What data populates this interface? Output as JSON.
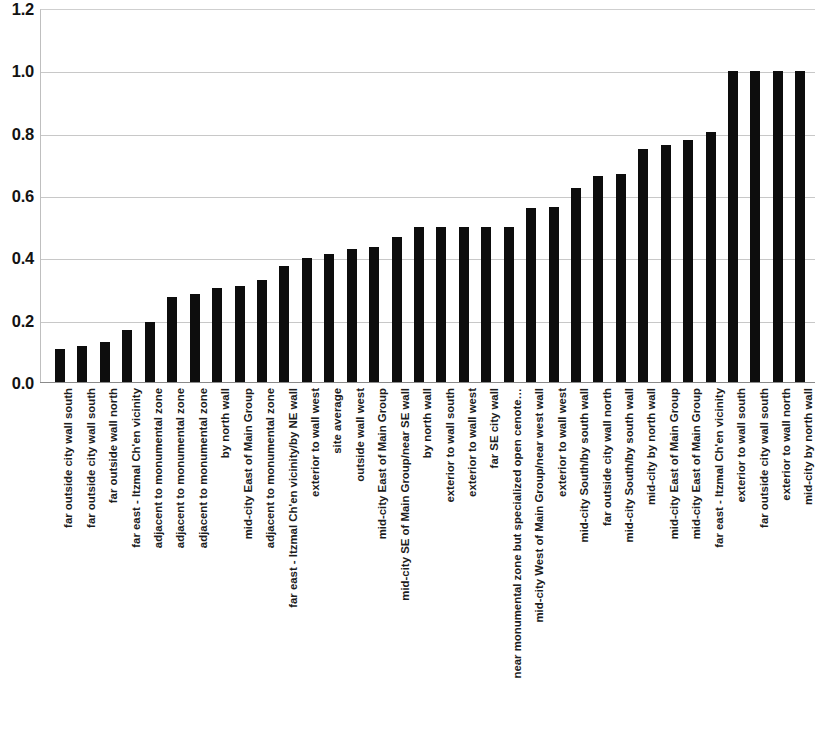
{
  "chart_data": {
    "type": "bar",
    "title": "",
    "subtitle": "",
    "xlabel": "",
    "ylabel": "",
    "ylim": [
      0.0,
      1.2
    ],
    "ytick_labels": [
      "1.2",
      "1.0",
      "0.8",
      "0.6",
      "0.4",
      "0.2",
      "0.0"
    ],
    "ytick_values": [
      1.2,
      1.0,
      0.8,
      0.6,
      0.4,
      0.2,
      0.0
    ],
    "grid": true,
    "gridlines_at": [
      1.0,
      0.8,
      0.6,
      0.4,
      0.2
    ],
    "legend": [],
    "legend_position": "none",
    "bar_color": "#0d0d0d",
    "note": "rightmost bar is clipped by the image edge",
    "categories": [
      "far outside city wall south",
      "far outside city wall south",
      "far outside wall north",
      "far east - Itzmal Ch'en vicinity",
      "adjacent to monumental zone",
      "adjacent to monumental zone",
      "adjacent to monumental zone",
      "by north wall",
      "mid-city East of Main Group",
      "adjacent to monumental zone",
      "far east - Itzmal Ch'en vicinity/by NE wall",
      "exterior to wall west",
      "site average",
      "outside wall west",
      "mid-city East of Main Group",
      "mid-city SE of Main Group/near SE wall",
      "by north wall",
      "exterior to wall south",
      "exterior to wall west",
      "far SE city wall",
      "near monumental zone but specialized open cenote…",
      "mid-city West of Main Group/near west wall",
      "exterior to wall west",
      "mid-city South/by south wall",
      "far outside city wall north",
      "mid-city South/by south wall",
      "mid-city by north wall",
      "mid-city East of Main Group",
      "mid-city East of Main Group",
      "far east - Itzmal Ch'en vicinity",
      "exterior to wall south",
      "far outside city wall south",
      "exterior to wall north",
      "mid-city by north wall"
    ],
    "values": [
      0.11,
      0.12,
      0.13,
      0.17,
      0.195,
      0.275,
      0.285,
      0.305,
      0.31,
      0.33,
      0.375,
      0.4,
      0.415,
      0.43,
      0.435,
      0.47,
      0.5,
      0.5,
      0.5,
      0.5,
      0.5,
      0.56,
      0.565,
      0.625,
      0.665,
      0.67,
      0.75,
      0.765,
      0.78,
      0.805,
      1.0,
      1.0,
      1.0,
      1.0
    ]
  }
}
